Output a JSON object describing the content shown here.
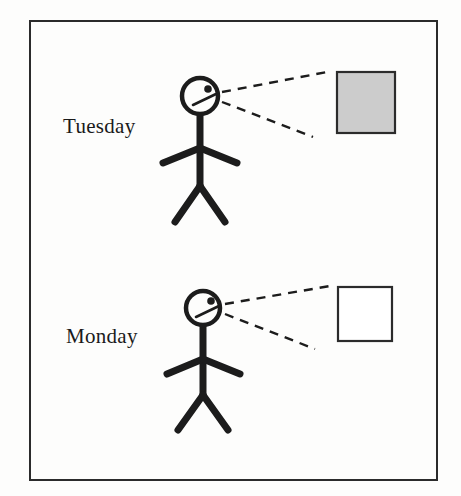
{
  "diagram": {
    "frame": {
      "name": "outer-border",
      "x": 29,
      "y": 20,
      "width": 409,
      "height": 461,
      "stroke": "#2b2b2b",
      "stroke_width": 2,
      "fill": "#fdfdfc"
    },
    "panels": [
      {
        "id": "tuesday",
        "label": "Tuesday",
        "label_x": 63,
        "label_y": 133,
        "figure": {
          "head_cx": 200,
          "head_cy": 96,
          "head_r": 18,
          "eye_cx": 208,
          "eye_cy": 89,
          "eye_r": 3.6,
          "nose_x1": 193,
          "nose_y1": 105,
          "nose_x2": 216,
          "nose_y2": 94,
          "torso_x": 200,
          "torso_y1": 114,
          "torso_y2": 186,
          "arm_left_x": 163,
          "arm_left_y": 163,
          "arm_right_x": 237,
          "arm_right_y": 163,
          "arm_join_y": 148,
          "leg_left_x": 175,
          "leg_left_y": 222,
          "leg_right_x": 225,
          "leg_right_y": 222,
          "stroke": "#1c1c1c",
          "stroke_width": 7
        },
        "sight_lines": [
          {
            "name": "upper-sight-line",
            "x1": 222,
            "y1": 92,
            "x2": 332,
            "y2": 71
          },
          {
            "name": "lower-sight-line",
            "x1": 222,
            "y1": 102,
            "x2": 313,
            "y2": 137
          }
        ],
        "object": {
          "name": "gray-square",
          "x": 336,
          "y": 71,
          "width": 60,
          "height": 63,
          "fill": "#cccccc",
          "stroke": "#2b2b2b",
          "stroke_width": 2,
          "state": "shaded"
        }
      },
      {
        "id": "monday",
        "label": "Monday",
        "label_x": 66,
        "label_y": 343,
        "figure": {
          "head_cx": 203,
          "head_cy": 308,
          "head_r": 17,
          "eye_cx": 211,
          "eye_cy": 301,
          "eye_r": 3.6,
          "nose_x1": 196,
          "nose_y1": 317,
          "nose_x2": 219,
          "nose_y2": 306,
          "torso_x": 203,
          "torso_y1": 325,
          "torso_y2": 395,
          "arm_left_x": 167,
          "arm_left_y": 374,
          "arm_right_x": 240,
          "arm_right_y": 374,
          "arm_join_y": 359,
          "leg_left_x": 178,
          "leg_left_y": 430,
          "leg_right_x": 228,
          "leg_right_y": 430,
          "stroke": "#1c1c1c",
          "stroke_width": 7
        },
        "sight_lines": [
          {
            "name": "upper-sight-line",
            "x1": 225,
            "y1": 304,
            "x2": 330,
            "y2": 286
          },
          {
            "name": "lower-sight-line",
            "x1": 225,
            "y1": 314,
            "x2": 315,
            "y2": 349
          }
        ],
        "object": {
          "name": "white-square",
          "x": 337,
          "y": 286,
          "width": 56,
          "height": 56,
          "fill": "#ffffff",
          "stroke": "#2b2b2b",
          "stroke_width": 2,
          "state": "unshaded"
        }
      }
    ],
    "dash_pattern": "9 7",
    "dash_stroke": "#1c1c1c",
    "dash_stroke_width": 2.4
  }
}
